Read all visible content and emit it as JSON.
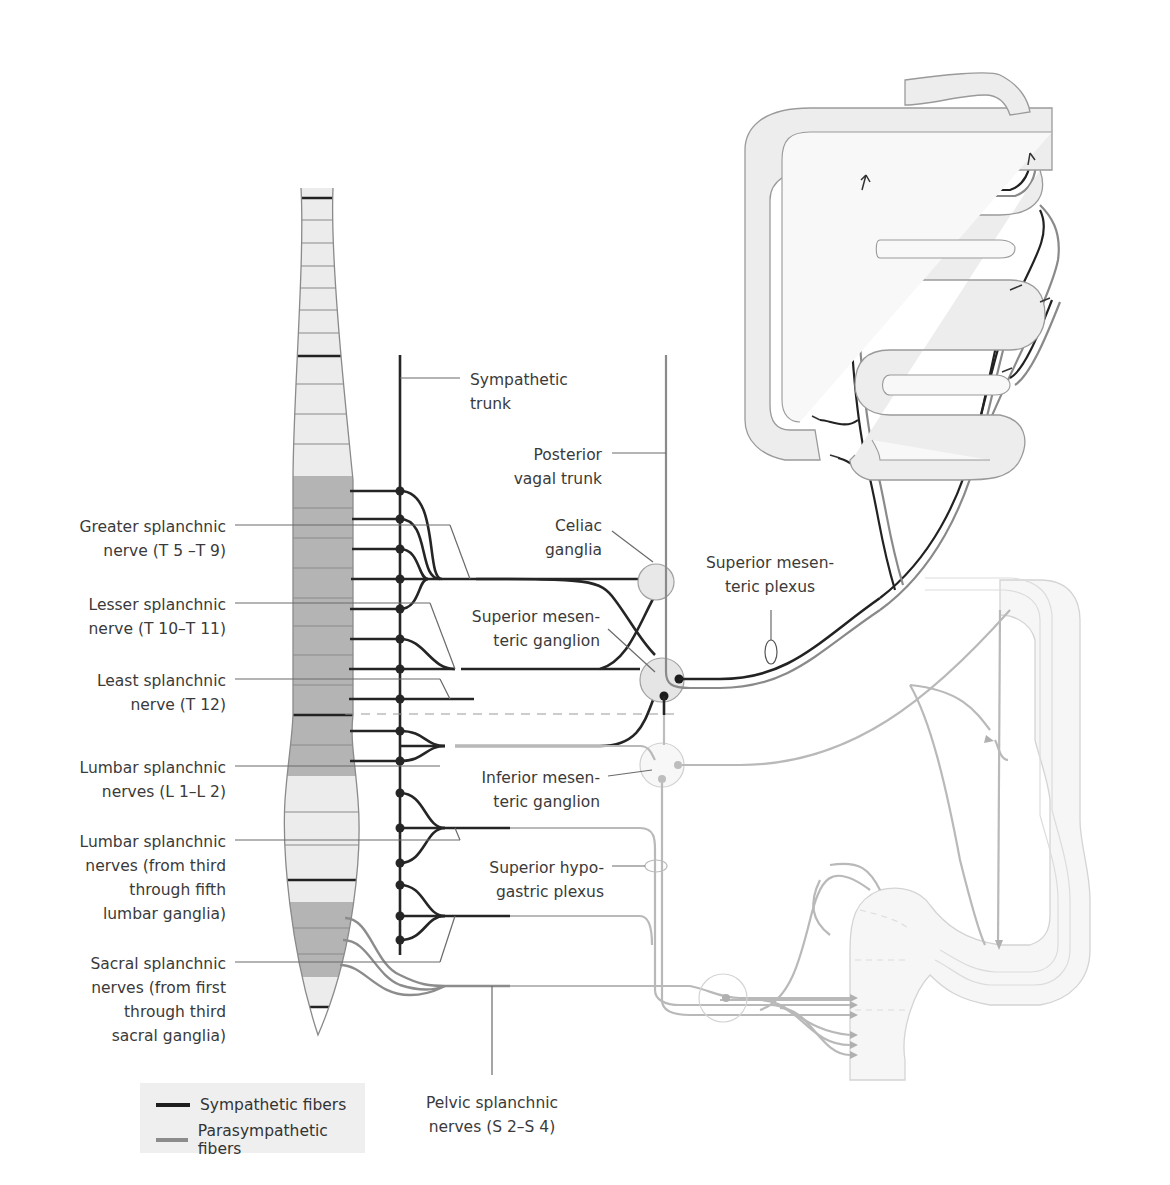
{
  "colors": {
    "sympathetic": "#2a2a2a",
    "parasympathetic": "#8c8c8c",
    "parasympathetic_light": "#bdbdbd",
    "spine_light": "#ececec",
    "spine_dark": "#b4b4b4",
    "organ_fill": "#ededed",
    "organ_stroke": "#9a9a9a",
    "ganglion_fill": "#e8e8e8",
    "label_text": "#3a3a3a"
  },
  "labels_left": [
    {
      "id": "greater-splanchnic",
      "lines": [
        "Greater splanchnic",
        "nerve (T 5 –T 9)"
      ]
    },
    {
      "id": "lesser-splanchnic",
      "lines": [
        "Lesser splanchnic",
        "nerve (T 10–T 11)"
      ]
    },
    {
      "id": "least-splanchnic",
      "lines": [
        "Least splanchnic",
        "nerve (T 12)"
      ]
    },
    {
      "id": "lumbar-splanchnic-l1-l2",
      "lines": [
        "Lumbar splanchnic",
        "nerves (L 1–L 2)"
      ]
    },
    {
      "id": "lumbar-splanchnic-3-5",
      "lines": [
        "Lumbar splanchnic",
        "nerves (from third",
        "through fifth",
        "lumbar ganglia)"
      ]
    },
    {
      "id": "sacral-splanchnic",
      "lines": [
        "Sacral splanchnic",
        "nerves (from first",
        "through third",
        "sacral ganglia)"
      ]
    }
  ],
  "labels_center": [
    {
      "id": "sympathetic-trunk",
      "lines": [
        "Sympathetic",
        "trunk"
      ]
    },
    {
      "id": "posterior-vagal-trunk",
      "lines": [
        "Posterior",
        "vagal trunk"
      ]
    },
    {
      "id": "celiac-ganglia",
      "lines": [
        "Celiac",
        "ganglia"
      ]
    },
    {
      "id": "superior-mesenteric-ganglion",
      "lines": [
        "Superior mesen-",
        "teric ganglion"
      ]
    },
    {
      "id": "superior-mesenteric-plexus",
      "lines": [
        "Superior mesen-",
        "teric plexus"
      ]
    },
    {
      "id": "inferior-mesenteric-ganglion",
      "lines": [
        "Inferior mesen-",
        "teric ganglion"
      ]
    },
    {
      "id": "superior-hypogastric-plexus",
      "lines": [
        "Superior hypo-",
        "gastric plexus"
      ]
    },
    {
      "id": "pelvic-splanchnic",
      "lines": [
        "Pelvic splanchnic",
        "nerves (S 2–S 4)"
      ]
    }
  ],
  "legend": {
    "items": [
      {
        "label": "Sympathetic fibers",
        "color": "#1f1f1f"
      },
      {
        "label": "Parasympathetic fibers",
        "color": "#8c8c8c"
      }
    ]
  }
}
